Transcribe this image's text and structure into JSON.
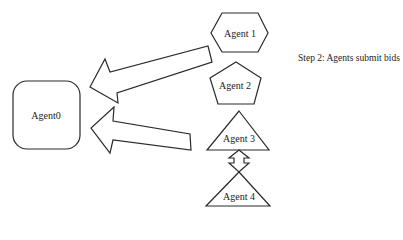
{
  "diagram": {
    "caption": "Step 2: Agents submit bids",
    "nodes": [
      {
        "id": "agent0",
        "label": "Agent0",
        "shape": "rounded-square"
      },
      {
        "id": "agent1",
        "label": "Agent 1",
        "shape": "hexagon"
      },
      {
        "id": "agent2",
        "label": "Agent 2",
        "shape": "pentagon"
      },
      {
        "id": "agent3",
        "label": "Agent 3",
        "shape": "triangle"
      },
      {
        "id": "agent4",
        "label": "Agent 4",
        "shape": "triangle"
      }
    ],
    "edges": [
      {
        "from": "agent1",
        "to": "agent0",
        "style": "block-arrow"
      },
      {
        "from": "agent3",
        "to": "agent0",
        "style": "block-arrow"
      },
      {
        "from": "agent3",
        "to": "agent4",
        "style": "double-block-arrow"
      }
    ],
    "colors": {
      "stroke": "#2a2a2a",
      "fill": "#ffffff"
    }
  }
}
